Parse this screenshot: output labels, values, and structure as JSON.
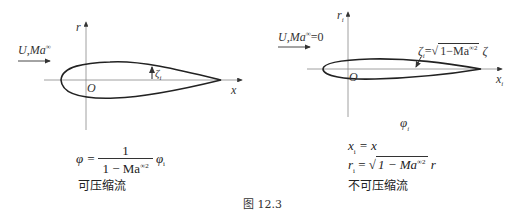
{
  "left_panel": {
    "freestream_label": "U,Ma",
    "freestream_sup": "∞",
    "axis_r_label": "r",
    "axis_x_label": "x",
    "origin_label": "O",
    "thickness_label": "ζ",
    "thickness_sub": "i",
    "equation": {
      "lhs": "φ =",
      "numerator": "1",
      "denominator": "1 − Ma",
      "denominator_sup": "∞2",
      "rhs": "φ",
      "rhs_sub": "i"
    },
    "caption": "可压缩流"
  },
  "right_panel": {
    "freestream_label": "U,Ma",
    "freestream_sup": "∞",
    "freestream_value": "=0",
    "axis_r_label": "r",
    "axis_r_sub": "i",
    "axis_x_label": "x",
    "axis_x_sub": "i",
    "origin_label": "O",
    "thickness_annotation": {
      "lhs": "ζ",
      "lhs_sub": "i",
      "eq": "=",
      "sqrt_content": "1−Ma",
      "sqrt_sup": "∞2",
      "rhs": "ζ"
    },
    "potential_label": "φ",
    "potential_sub": "i",
    "equations": [
      {
        "lhs": "x",
        "lhs_sub": "i",
        "rhs": "= x"
      },
      {
        "lhs": "r",
        "lhs_sub": "i",
        "eq": "=",
        "sqrt_content": "1 − Ma",
        "sqrt_sup": "∞2",
        "rhs": "r"
      }
    ],
    "caption": "不可压缩流"
  },
  "figure_caption": "图 12.3"
}
